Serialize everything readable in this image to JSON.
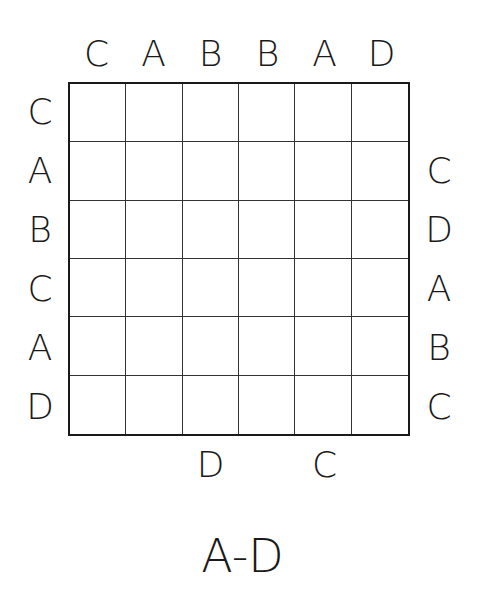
{
  "puzzle": {
    "title": "A-D",
    "grid_size": {
      "rows": 6,
      "cols": 6
    },
    "clues": {
      "top": [
        "C",
        "A",
        "B",
        "B",
        "A",
        "D"
      ],
      "left": [
        "C",
        "A",
        "B",
        "C",
        "A",
        "D"
      ],
      "right": [
        "",
        "C",
        "D",
        "A",
        "B",
        "C"
      ],
      "bottom": [
        "",
        "",
        "D",
        "",
        "C",
        ""
      ]
    },
    "cells": [
      [
        "",
        "",
        "",
        "",
        "",
        ""
      ],
      [
        "",
        "",
        "",
        "",
        "",
        ""
      ],
      [
        "",
        "",
        "",
        "",
        "",
        ""
      ],
      [
        "",
        "",
        "",
        "",
        "",
        ""
      ],
      [
        "",
        "",
        "",
        "",
        "",
        ""
      ],
      [
        "",
        "",
        "",
        "",
        "",
        ""
      ]
    ]
  }
}
